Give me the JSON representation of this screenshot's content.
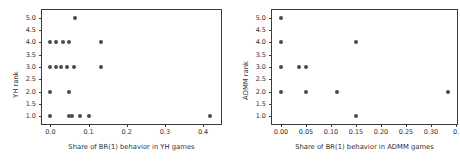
{
  "figure": {
    "background": "#ffffff",
    "marker_color": "#4a4a52",
    "axis_color": "#3b3b3b"
  },
  "chart_data": [
    {
      "type": "scatter",
      "panel": "left",
      "title": "",
      "xlabel": "Share of BR(1) behavior in YH games",
      "ylabel": "YH rank",
      "xlim": [
        -0.022,
        0.447
      ],
      "ylim": [
        5.32,
        0.68
      ],
      "y_inverted": true,
      "grid": false,
      "legend": null,
      "xticks": [
        0.0,
        0.1,
        0.2,
        0.3,
        0.4
      ],
      "xticklabels": [
        "0.0",
        "0.1",
        "0.2",
        "0.3",
        "0.4"
      ],
      "yticks": [
        1.0,
        1.5,
        2.0,
        2.5,
        3.0,
        3.5,
        4.0,
        4.5,
        5.0
      ],
      "yticklabels": [
        "1.0",
        "1.5",
        "2.0",
        "2.5",
        "3.0",
        "3.5",
        "4.0",
        "4.5",
        "5.0"
      ],
      "points": [
        {
          "x": 0.0,
          "y": 1.0
        },
        {
          "x": 0.048,
          "y": 1.0
        },
        {
          "x": 0.057,
          "y": 1.0
        },
        {
          "x": 0.077,
          "y": 1.0
        },
        {
          "x": 0.1,
          "y": 1.0
        },
        {
          "x": 0.417,
          "y": 1.0
        },
        {
          "x": 0.0,
          "y": 2.0
        },
        {
          "x": 0.05,
          "y": 2.0
        },
        {
          "x": 0.0,
          "y": 3.0
        },
        {
          "x": 0.015,
          "y": 3.0
        },
        {
          "x": 0.029,
          "y": 3.0
        },
        {
          "x": 0.044,
          "y": 3.0
        },
        {
          "x": 0.062,
          "y": 3.0
        },
        {
          "x": 0.133,
          "y": 3.0
        },
        {
          "x": 0.0,
          "y": 4.0
        },
        {
          "x": 0.015,
          "y": 4.0
        },
        {
          "x": 0.032,
          "y": 4.0
        },
        {
          "x": 0.05,
          "y": 4.0
        },
        {
          "x": 0.133,
          "y": 4.0
        },
        {
          "x": 0.065,
          "y": 5.0
        }
      ]
    },
    {
      "type": "scatter",
      "panel": "right",
      "title": "",
      "xlabel": "Share of BR(1) behavior in ADMM games",
      "ylabel": "ADMM rank",
      "xlim": [
        -0.018,
        0.352
      ],
      "ylim": [
        5.32,
        0.68
      ],
      "y_inverted": true,
      "grid": false,
      "legend": null,
      "xticks": [
        0.0,
        0.05,
        0.1,
        0.15,
        0.2,
        0.25,
        0.3,
        0.35
      ],
      "xticklabels": [
        "0.00",
        "0.05",
        "0.10",
        "0.15",
        "0.20",
        "0.25",
        "0.30",
        "0."
      ],
      "yticks": [
        1.0,
        1.5,
        2.0,
        2.5,
        3.0,
        3.5,
        4.0,
        4.5,
        5.0
      ],
      "yticklabels": [
        "1.0",
        "1.5",
        "2.0",
        "2.5",
        "3.0",
        "3.5",
        "4.0",
        "4.5",
        "5.0"
      ],
      "points": [
        {
          "x": 0.15,
          "y": 1.0
        },
        {
          "x": 0.0,
          "y": 2.0
        },
        {
          "x": 0.05,
          "y": 2.0
        },
        {
          "x": 0.111,
          "y": 2.0
        },
        {
          "x": 0.333,
          "y": 2.0
        },
        {
          "x": 0.0,
          "y": 3.0
        },
        {
          "x": 0.035,
          "y": 3.0
        },
        {
          "x": 0.05,
          "y": 3.0
        },
        {
          "x": 0.0,
          "y": 4.0
        },
        {
          "x": 0.15,
          "y": 4.0
        },
        {
          "x": 0.0,
          "y": 5.0
        }
      ]
    }
  ]
}
